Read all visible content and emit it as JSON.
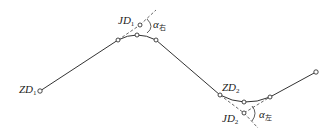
{
  "diagram": {
    "type": "route-alignment",
    "colors": {
      "line": "#333333",
      "dashed": "#444444",
      "text": "#222222"
    },
    "labels": {
      "zd1": {
        "main": "ZD",
        "sub": "1"
      },
      "jd1": {
        "main": "JD",
        "sub": "1"
      },
      "alpha1": {
        "main": "α",
        "sub": "右"
      },
      "zd2": {
        "main": "ZD",
        "sub": "2"
      },
      "jd2": {
        "main": "JD",
        "sub": "2"
      },
      "alpha2": {
        "main": "α",
        "sub": "左"
      }
    }
  }
}
